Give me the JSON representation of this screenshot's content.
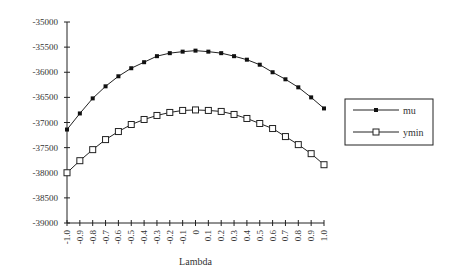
{
  "chart_data": {
    "type": "line",
    "title": "",
    "xlabel": "Lambda",
    "ylabel": "",
    "x": [
      -1.0,
      -0.9,
      -0.8,
      -0.7,
      -0.6,
      -0.5,
      -0.4,
      -0.3,
      -0.2,
      -0.1,
      0,
      0.1,
      0.2,
      0.3,
      0.4,
      0.5,
      0.6,
      0.7,
      0.8,
      0.9,
      1.0
    ],
    "x_tick_labels": [
      "-1.0",
      "-0.9",
      "-0.8",
      "-0.7",
      "-0.6",
      "-0.5",
      "-0.4",
      "-0.3",
      "-0.2",
      "-0.1",
      "0",
      "0.1",
      "0.2",
      "0.3",
      "0.4",
      "0.5",
      "0.6",
      "0.7",
      "0.8",
      "0.9",
      "1.0"
    ],
    "ylim": [
      -39000,
      -35000
    ],
    "y_ticks": [
      -35000,
      -35500,
      -36000,
      -36500,
      -37000,
      -37500,
      -38000,
      -38500,
      -39000
    ],
    "y_tick_labels": [
      "-35000",
      "-35500",
      "-36000",
      "-36500",
      "-37000",
      "-37500",
      "-38000",
      "-38500",
      "-39000"
    ],
    "grid": false,
    "legend_position": "right",
    "series": [
      {
        "name": "mu",
        "marker": "filled-square",
        "values": [
          -37140,
          -36820,
          -36520,
          -36280,
          -36080,
          -35920,
          -35800,
          -35680,
          -35620,
          -35590,
          -35570,
          -35590,
          -35620,
          -35680,
          -35750,
          -35850,
          -36000,
          -36140,
          -36300,
          -36500,
          -36720
        ]
      },
      {
        "name": "ymin",
        "marker": "open-square",
        "values": [
          -38000,
          -37760,
          -37540,
          -37340,
          -37180,
          -37040,
          -36940,
          -36860,
          -36800,
          -36760,
          -36750,
          -36760,
          -36780,
          -36840,
          -36920,
          -37020,
          -37120,
          -37280,
          -37440,
          -37620,
          -37840
        ]
      }
    ]
  }
}
